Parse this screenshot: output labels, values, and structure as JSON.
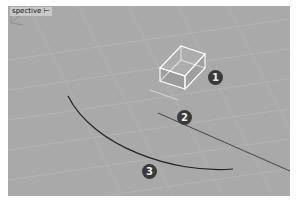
{
  "viewport": {
    "label": "spective",
    "menu_caret": "⊢",
    "background": "#a9a9a9"
  },
  "callouts": [
    {
      "number": "1",
      "target": "box-object"
    },
    {
      "number": "2",
      "target": "line-object"
    },
    {
      "number": "3",
      "target": "arc-curve"
    }
  ],
  "colors": {
    "badge_bg": "#3a3a3a",
    "badge_text": "#f0f0f0",
    "box_edge": "#ffffff",
    "curve": "#2a2a2a",
    "grid": "#b6b6b6"
  }
}
